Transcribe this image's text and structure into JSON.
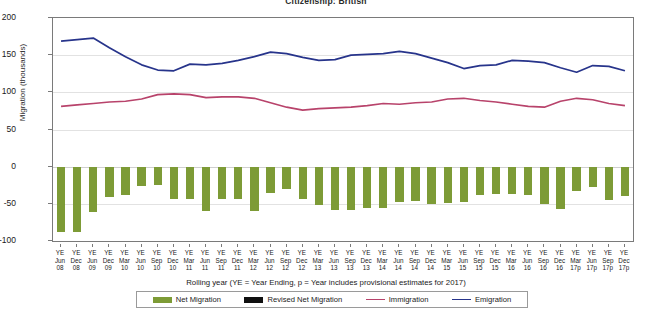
{
  "chart_data": {
    "type": "bar",
    "title": "Citizenship: British",
    "xlabel": "Rolling year (YE = Year Ending, p = Year includes provisional estimates for 2017)",
    "ylabel": "Migration (thousands)",
    "ylim": [
      -100,
      200
    ],
    "yticks": [
      200,
      150,
      100,
      50,
      0,
      -50,
      -100
    ],
    "ytick_labels": [
      "200",
      "150",
      "100",
      "50",
      "0",
      "-50",
      "-100"
    ],
    "grid": true,
    "legend_position": "bottom",
    "categories": [
      "YE Jun 08",
      "YE Dec 08",
      "YE Jun 09",
      "YE Dec 09",
      "YE Mar 10",
      "YE Jun 10",
      "YE Sep 10",
      "YE Dec 10",
      "YE Mar 11",
      "YE Jun 11",
      "YE Sep 11",
      "YE Dec 11",
      "YE Mar 12",
      "YE Jun 12",
      "YE Sep 12",
      "YE Dec 12",
      "YE Mar 13",
      "YE Jun 13",
      "YE Sep 13",
      "YE Dec 13",
      "YE Mar 14",
      "YE Jun 14",
      "YE Sep 14",
      "YE Dec 14",
      "YE Mar 15",
      "YE Jun 15",
      "YE Sep 15",
      "YE Dec 15",
      "YE Mar 16",
      "YE Jun 16",
      "YE Sep 16",
      "YE Dec 16",
      "YE Mar 17p",
      "YE Jun 17p",
      "YE Sep 17p",
      "YE Dec 17p"
    ],
    "categories_lines": [
      [
        "YE",
        "Jun",
        "08"
      ],
      [
        "YE",
        "Dec",
        "08"
      ],
      [
        "YE",
        "Jun",
        "09"
      ],
      [
        "YE",
        "Dec",
        "09"
      ],
      [
        "YE",
        "Mar",
        "10"
      ],
      [
        "YE",
        "Jun",
        "10"
      ],
      [
        "YE",
        "Sep",
        "10"
      ],
      [
        "YE",
        "Dec",
        "10"
      ],
      [
        "YE",
        "Mar",
        "11"
      ],
      [
        "YE",
        "Jun",
        "11"
      ],
      [
        "YE",
        "Sep",
        "11"
      ],
      [
        "YE",
        "Dec",
        "11"
      ],
      [
        "YE",
        "Mar",
        "12"
      ],
      [
        "YE",
        "Jun",
        "12"
      ],
      [
        "YE",
        "Sep",
        "12"
      ],
      [
        "YE",
        "Dec",
        "12"
      ],
      [
        "YE",
        "Mar",
        "13"
      ],
      [
        "YE",
        "Jun",
        "13"
      ],
      [
        "YE",
        "Sep",
        "13"
      ],
      [
        "YE",
        "Dec",
        "13"
      ],
      [
        "YE",
        "Mar",
        "14"
      ],
      [
        "YE",
        "Jun",
        "14"
      ],
      [
        "YE",
        "Sep",
        "14"
      ],
      [
        "YE",
        "Dec",
        "14"
      ],
      [
        "YE",
        "Mar",
        "15"
      ],
      [
        "YE",
        "Jun",
        "15"
      ],
      [
        "YE",
        "Sep",
        "15"
      ],
      [
        "YE",
        "Dec",
        "15"
      ],
      [
        "YE",
        "Mar",
        "16"
      ],
      [
        "YE",
        "Jun",
        "16"
      ],
      [
        "YE",
        "Sep",
        "16"
      ],
      [
        "YE",
        "Dec",
        "16"
      ],
      [
        "YE",
        "Mar",
        "17p"
      ],
      [
        "YE",
        "Jun",
        "17p"
      ],
      [
        "YE",
        "Sep",
        "17p"
      ],
      [
        "YE",
        "Dec",
        "17p"
      ]
    ],
    "series": [
      {
        "name": "Net Migration",
        "kind": "bar",
        "color": "#7d9b36",
        "values": [
          -88,
          -88,
          -61,
          -41,
          -38,
          -26,
          -25,
          -43,
          -43,
          -59,
          -43,
          -43,
          -59,
          -35,
          -30,
          -44,
          -51,
          -58,
          -58,
          -55,
          -55,
          -47,
          -46,
          -50,
          -49,
          -48,
          -38,
          -37,
          -37,
          -38,
          -50,
          -57,
          -33,
          -28,
          -45,
          -40
        ]
      },
      {
        "name": "Revised Net Migration",
        "kind": "bar",
        "color": "#101010",
        "values": [
          null,
          null,
          null,
          null,
          null,
          null,
          null,
          null,
          null,
          null,
          null,
          null,
          null,
          null,
          null,
          null,
          null,
          null,
          null,
          null,
          null,
          null,
          null,
          null,
          null,
          null,
          null,
          null,
          null,
          null,
          null,
          null,
          null,
          null,
          null,
          null
        ]
      },
      {
        "name": "Immigration",
        "kind": "line",
        "color": "#b8436b",
        "values": [
          81,
          83,
          85,
          87,
          88,
          91,
          97,
          98,
          97,
          93,
          94,
          94,
          92,
          86,
          80,
          76,
          78,
          79,
          80,
          82,
          85,
          84,
          86,
          87,
          91,
          92,
          89,
          87,
          84,
          81,
          80,
          88,
          92,
          90,
          85,
          82
        ]
      },
      {
        "name": "Emigration",
        "kind": "line",
        "color": "#27348b",
        "values": [
          169,
          171,
          173,
          160,
          148,
          137,
          130,
          129,
          138,
          137,
          139,
          143,
          148,
          154,
          152,
          147,
          143,
          144,
          150,
          151,
          152,
          155,
          152,
          146,
          140,
          132,
          136,
          137,
          143,
          142,
          140,
          133,
          127,
          136,
          135,
          129
        ]
      }
    ],
    "legend": [
      {
        "label": "Net Migration",
        "type": "bar",
        "color": "#7d9b36"
      },
      {
        "label": "Revised Net Migration",
        "type": "bar",
        "color": "#101010"
      },
      {
        "label": "Immigration",
        "type": "line",
        "color": "#b8436b"
      },
      {
        "label": "Emigration",
        "type": "line",
        "color": "#27348b"
      }
    ]
  }
}
